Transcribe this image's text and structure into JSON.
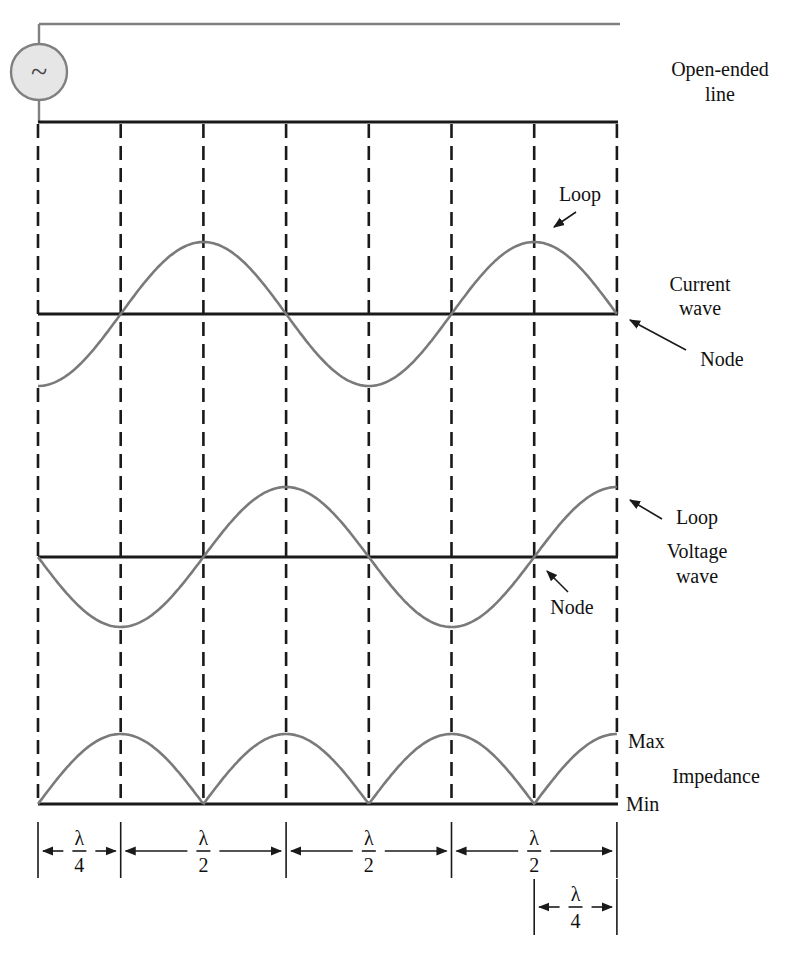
{
  "source": {
    "symbol": "~",
    "icon": "ac-source-icon"
  },
  "labels": {
    "line_type_1": "Open-ended",
    "line_type_2": "line",
    "current_1": "Current",
    "current_2": "wave",
    "voltage_1": "Voltage",
    "voltage_2": "wave",
    "current_loop": "Loop",
    "current_node": "Node",
    "voltage_loop": "Loop",
    "voltage_node": "Node",
    "impedance": "Impedance",
    "max": "Max",
    "min": "Min"
  },
  "dimensions": [
    {
      "numerator": "λ",
      "denominator": "4",
      "span_quarter_wavelengths": 1
    },
    {
      "numerator": "λ",
      "denominator": "2",
      "span_quarter_wavelengths": 2
    },
    {
      "numerator": "λ",
      "denominator": "2",
      "span_quarter_wavelengths": 2
    },
    {
      "numerator": "λ",
      "denominator": "2",
      "span_quarter_wavelengths": 2
    },
    {
      "numerator": "λ",
      "denominator": "4",
      "span_quarter_wavelengths": 1,
      "note": "last quarter, below"
    }
  ],
  "segments_quarter_wavelength": 7,
  "colors": {
    "wave": "#7a7a7a",
    "line": "#1a1a1a",
    "source_fill": "#e6e6e6"
  }
}
